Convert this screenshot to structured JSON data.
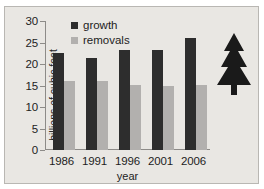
{
  "chart_data": {
    "type": "bar",
    "title": "",
    "xlabel": "year",
    "ylabel": "billions of cubic feet",
    "categories": [
      "1986",
      "1991",
      "1996",
      "2001",
      "2006"
    ],
    "ylim": [
      0,
      30
    ],
    "yticks": [
      0,
      5,
      10,
      15,
      20,
      25,
      30
    ],
    "ytick_labels": [
      "0",
      "5",
      "10",
      "15",
      "20",
      "25",
      "30"
    ],
    "grid": false,
    "legend_position": "top-left-inside",
    "series": [
      {
        "name": "growth",
        "color": "#2d2d2d",
        "values": [
          22.5,
          21.5,
          23.2,
          23.2,
          26.0
        ]
      },
      {
        "name": "removals",
        "color": "#b2b0ae",
        "values": [
          16.0,
          16.0,
          15.2,
          15.0,
          15.2
        ]
      }
    ],
    "annotations": [
      {
        "name": "pine-tree-icon",
        "color": "#1a1a1a",
        "description": "evergreen tree silhouette"
      }
    ]
  },
  "figure": {
    "background_color": "#e9e7e3",
    "border_color": "#b9b7b3",
    "axis_color": "#8d8b88"
  }
}
